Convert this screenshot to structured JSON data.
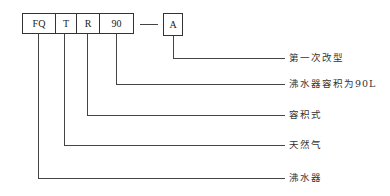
{
  "diagram": {
    "type": "model-code-breakdown",
    "code_segments": [
      {
        "id": "fq",
        "text": "FQ",
        "meaning": "沸水器"
      },
      {
        "id": "t",
        "text": "T",
        "meaning": "天然气"
      },
      {
        "id": "r",
        "text": "R",
        "meaning": "容积式"
      },
      {
        "id": "vol",
        "text": "90",
        "meaning": "沸水器容积为90L"
      }
    ],
    "separator": "—",
    "suffix": {
      "id": "a",
      "text": "A",
      "meaning": "第一次改型"
    },
    "labels": {
      "a": "第一次改型",
      "vol": "沸水器容积为90L",
      "r": "容积式",
      "t": "天然气",
      "fq": "沸水器"
    }
  }
}
